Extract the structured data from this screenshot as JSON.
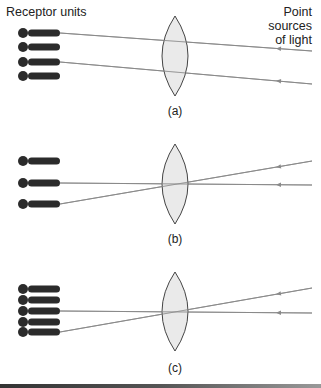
{
  "labels": {
    "receptor_units": "Receptor units",
    "point_sources_line1": "Point sources",
    "point_sources_line2": "of light"
  },
  "panels": [
    {
      "id": "a",
      "caption": "(a)",
      "receptor_y": [
        33,
        47,
        62,
        76
      ],
      "lens": {
        "cx": 175,
        "top": 16,
        "bottom": 96,
        "half_width": 13
      },
      "rays": [
        {
          "from": [
            312,
            51
          ],
          "to": [
            60,
            33
          ]
        },
        {
          "from": [
            312,
            84
          ],
          "to": [
            60,
            62
          ]
        }
      ]
    },
    {
      "id": "b",
      "caption": "(b)",
      "receptor_y": [
        161,
        183,
        204
      ],
      "lens": {
        "cx": 175,
        "top": 144,
        "bottom": 224,
        "half_width": 13
      },
      "rays": [
        {
          "from": [
            312,
            161
          ],
          "to": [
            60,
            204
          ]
        },
        {
          "from": [
            312,
            185
          ],
          "to": [
            60,
            183
          ]
        }
      ]
    },
    {
      "id": "c",
      "caption": "(c)",
      "receptor_y": [
        289,
        300,
        311,
        322,
        332
      ],
      "lens": {
        "cx": 175,
        "top": 272,
        "bottom": 351,
        "half_width": 13
      },
      "rays": [
        {
          "from": [
            312,
            288
          ],
          "to": [
            60,
            332
          ]
        },
        {
          "from": [
            312,
            313
          ],
          "to": [
            60,
            311
          ]
        }
      ]
    }
  ],
  "colors": {
    "receptor": "#2b2b2b",
    "ray": "#8a8a8a",
    "lens_fill": "#e6e6e6",
    "lens_stroke": "#444444"
  }
}
